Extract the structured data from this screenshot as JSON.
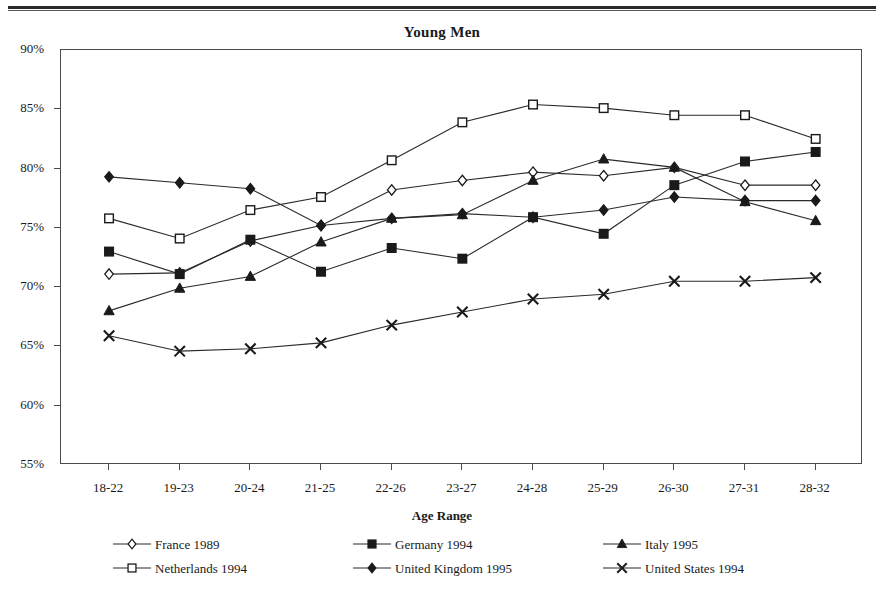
{
  "chart_data": {
    "type": "line",
    "title": "Young Men",
    "xlabel": "Age Range",
    "ylabel": "",
    "categories": [
      "18-22",
      "19-23",
      "20-24",
      "21-25",
      "22-26",
      "23-27",
      "24-28",
      "25-29",
      "26-30",
      "27-31",
      "28-32"
    ],
    "ytick_labels": [
      "90%",
      "85%",
      "80%",
      "75%",
      "70%",
      "65%",
      "60%",
      "55%"
    ],
    "ytick_values": [
      90,
      85,
      80,
      75,
      70,
      65,
      60,
      55
    ],
    "ylim": [
      55,
      90
    ],
    "grid": false,
    "legend_position": "bottom",
    "value_suffix": "%",
    "series": [
      {
        "name": "France 1989",
        "marker": "diamond-open",
        "values": [
          71.1,
          71.2,
          73.9,
          75.2,
          78.2,
          79.0,
          79.7,
          79.4,
          80.1,
          78.6,
          78.6
        ]
      },
      {
        "name": "Germany 1994",
        "marker": "square-filled",
        "values": [
          73.0,
          71.1,
          74.0,
          71.3,
          73.3,
          72.4,
          75.9,
          74.5,
          78.6,
          80.6,
          81.4
        ]
      },
      {
        "name": "Italy 1995",
        "marker": "triangle-filled",
        "values": [
          68.0,
          69.9,
          70.9,
          73.8,
          75.8,
          76.1,
          79.0,
          80.8,
          80.1,
          77.2,
          75.6
        ]
      },
      {
        "name": "Netherlands 1994",
        "marker": "square-open",
        "values": [
          75.8,
          74.1,
          76.5,
          77.6,
          80.7,
          83.9,
          85.4,
          85.1,
          84.5,
          84.5,
          82.5
        ]
      },
      {
        "name": "United Kingdom 1995",
        "marker": "diamond-filled",
        "values": [
          79.3,
          78.8,
          78.3,
          75.2,
          75.8,
          76.2,
          75.9,
          76.5,
          77.6,
          77.3,
          77.3
        ]
      },
      {
        "name": "United States 1994",
        "marker": "cross",
        "values": [
          65.9,
          64.6,
          64.8,
          65.3,
          66.8,
          67.9,
          69.0,
          69.4,
          70.5,
          70.5,
          70.8
        ]
      }
    ]
  },
  "axis_title": {
    "x": "Age Range"
  },
  "colors": {
    "ink": "#1a1a1a",
    "axis": "#4a4a4a",
    "line": "#2a2a2a"
  }
}
